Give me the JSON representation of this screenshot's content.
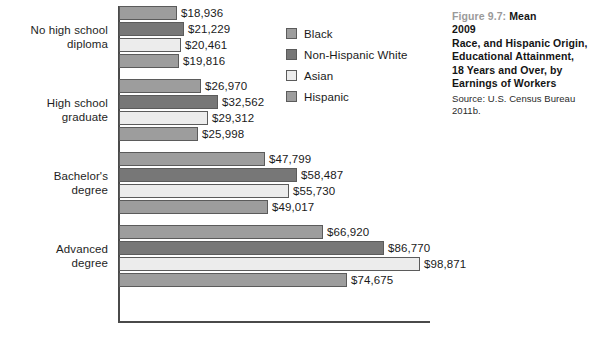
{
  "caption": {
    "figure_number": "Figure 9.7:",
    "title_lines": [
      "Mean",
      "Earnings of Workers",
      "18 Years and Over, by",
      "Educational Attainment,",
      "Race, and Hispanic Origin,",
      "2009"
    ],
    "source": "Source: U.S. Census Bureau 2011b."
  },
  "legend": {
    "items": [
      {
        "label": "Black",
        "color": "#9d9d9d"
      },
      {
        "label": "Non-Hispanic White",
        "color": "#777777"
      },
      {
        "label": "Asian",
        "color": "#ececec"
      },
      {
        "label": "Hispanic",
        "color": "#9d9d9d"
      }
    ]
  },
  "chart_data": {
    "type": "bar",
    "orientation": "horizontal",
    "xlabel": "",
    "ylabel": "",
    "grid": false,
    "legend_position": "right",
    "axis_range": [
      0,
      98871
    ],
    "value_prefix": "$",
    "categories": [
      "No high school diploma",
      "High school graduate",
      "Bachelor's degree",
      "Advanced degree"
    ],
    "category_label_lines": [
      [
        "No high school",
        "diploma"
      ],
      [
        "High school",
        "graduate"
      ],
      [
        "Bachelor's",
        "degree"
      ],
      [
        "Advanced",
        "degree"
      ]
    ],
    "series": [
      {
        "name": "Black",
        "color": "#9d9d9d",
        "values": [
          18936,
          26970,
          47799,
          66920
        ],
        "labels": [
          "$18,936",
          "$26,970",
          "$47,799",
          "$66,920"
        ]
      },
      {
        "name": "Non-Hispanic White",
        "color": "#777777",
        "values": [
          21229,
          32562,
          58487,
          86770
        ],
        "labels": [
          "$21,229",
          "$32,562",
          "$58,487",
          "$86,770"
        ]
      },
      {
        "name": "Asian",
        "color": "#ececec",
        "values": [
          20461,
          29312,
          55730,
          98871
        ],
        "labels": [
          "$20,461",
          "$29,312",
          "$55,730",
          "$98,871"
        ]
      },
      {
        "name": "Hispanic",
        "color": "#9d9d9d",
        "values": [
          19816,
          25998,
          49017,
          74675
        ],
        "labels": [
          "$19,816",
          "$25,998",
          "$49,017",
          "$74,675"
        ]
      }
    ]
  }
}
